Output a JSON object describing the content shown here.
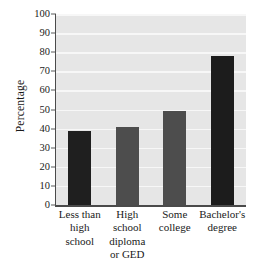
{
  "chart_data": {
    "type": "bar",
    "title": "",
    "xlabel": "",
    "ylabel": "Percentage",
    "categories": [
      "Less than high school",
      "High school diploma or GED",
      "Some college",
      "Bachelor's degree"
    ],
    "category_lines": [
      [
        "Less than",
        "high",
        "school"
      ],
      [
        "High",
        "school",
        "diploma",
        "or GED"
      ],
      [
        "Some",
        "college"
      ],
      [
        "Bachelor's",
        "degree"
      ]
    ],
    "values": [
      39,
      41,
      49,
      78
    ],
    "ylim": [
      0,
      100
    ],
    "ytick_step": 10,
    "yticks": [
      "0",
      "10",
      "20",
      "30",
      "40",
      "50",
      "60",
      "70",
      "80",
      "90",
      "100"
    ],
    "grid": "horizontal",
    "legend": "none",
    "bar_colors": [
      "#1f1f1f",
      "#4d4d4d",
      "#4d4d4d",
      "#1c1c1c"
    ],
    "panel_color": "#e6e6e6",
    "gridline_color": "#f7f7f7",
    "axis_color": "#4a4a4a",
    "background_color": "#ffffff"
  },
  "axis": {
    "y_title": "Percentage"
  }
}
